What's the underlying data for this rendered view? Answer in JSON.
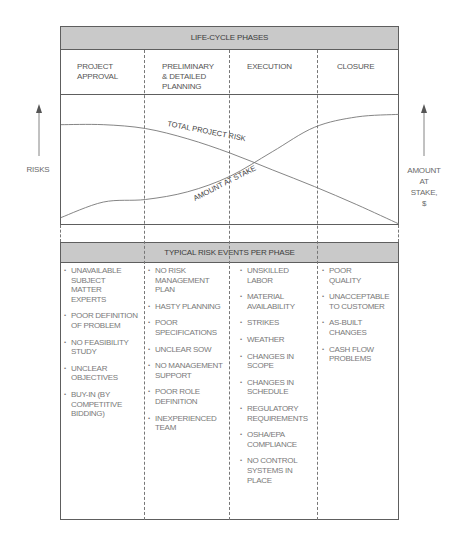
{
  "title": "LIFE-CYCLE PHASES",
  "phases": [
    {
      "label": "PROJECT APPROVAL",
      "lines": [
        "PROJECT",
        "APPROVAL"
      ]
    },
    {
      "label": "PRELIMINARY & DETAILED PLANNING",
      "lines": [
        "PRELIMINARY",
        "& DETAILED",
        "PLANNING"
      ]
    },
    {
      "label": "EXECUTION",
      "lines": [
        "EXECUTION"
      ]
    },
    {
      "label": "CLOSURE",
      "lines": [
        "CLOSURE"
      ]
    }
  ],
  "left_axis_label": "RISKS",
  "right_axis_label_lines": [
    "AMOUNT",
    "AT",
    "STAKE,",
    "$"
  ],
  "chart_data": {
    "type": "line",
    "title": "",
    "xlabel": "Life-cycle phases",
    "ylabel": "Risks / Amount at stake ($)",
    "x": [
      0,
      0.5,
      1,
      1.5,
      2,
      2.5,
      3,
      3.5,
      4
    ],
    "xlim": [
      0,
      4
    ],
    "ylim": [
      0,
      1
    ],
    "grid": false,
    "series": [
      {
        "name": "TOTAL PROJECT RISK",
        "values": [
          0.77,
          0.77,
          0.74,
          0.66,
          0.55,
          0.42,
          0.29,
          0.15,
          0.0
        ]
      },
      {
        "name": "AMOUNT AT STAKE",
        "values": [
          0.05,
          0.17,
          0.19,
          0.25,
          0.37,
          0.56,
          0.75,
          0.83,
          0.85
        ]
      }
    ],
    "annotations": [
      "TOTAL PROJECT RISK",
      "AMOUNT AT STAKE"
    ]
  },
  "risk_events_title": "TYPICAL RISK EVENTS PER PHASE",
  "risk_events": [
    {
      "phase": "PROJECT APPROVAL",
      "items": [
        [
          "UNAVAILABLE",
          "SUBJECT",
          "MATTER",
          "EXPERTS"
        ],
        [
          "POOR DEFINITION",
          "OF PROBLEM"
        ],
        [
          "NO FEASIBILITY",
          "STUDY"
        ],
        [
          "UNCLEAR",
          "OBJECTIVES"
        ],
        [
          "BUY-IN (BY",
          "COMPETITIVE",
          "BIDDING)"
        ]
      ]
    },
    {
      "phase": "PRELIMINARY & DETAILED PLANNING",
      "items": [
        [
          "NO RISK",
          "MANAGEMENT",
          "PLAN"
        ],
        [
          "HASTY PLANNING"
        ],
        [
          "POOR",
          "SPECIFICATIONS"
        ],
        [
          "UNCLEAR SOW"
        ],
        [
          "NO MANAGEMENT",
          "SUPPORT"
        ],
        [
          "POOR ROLE",
          "DEFINITION"
        ],
        [
          "INEXPERIENCED",
          "TEAM"
        ]
      ]
    },
    {
      "phase": "EXECUTION",
      "items": [
        [
          "UNSKILLED",
          "LABOR"
        ],
        [
          "MATERIAL",
          "AVAILABILITY"
        ],
        [
          "STRIKES"
        ],
        [
          "WEATHER"
        ],
        [
          "CHANGES IN",
          "SCOPE"
        ],
        [
          "CHANGES IN",
          "SCHEDULE"
        ],
        [
          "REGULATORY",
          "REQUIREMENTS"
        ],
        [
          "OSHA/EPA",
          "COMPLIANCE"
        ],
        [
          "NO CONTROL",
          "SYSTEMS IN",
          "PLACE"
        ]
      ]
    },
    {
      "phase": "CLOSURE",
      "items": [
        [
          "POOR",
          "QUALITY"
        ],
        [
          "UNACCEPTABLE",
          "TO CUSTOMER"
        ],
        [
          "AS-BUILT",
          "CHANGES"
        ],
        [
          "CASH FLOW",
          "PROBLEMS"
        ]
      ]
    }
  ],
  "bullet": "•",
  "colors": {
    "band": "#c9c9c9",
    "line": "#777777",
    "border": "#5e5e5e"
  }
}
